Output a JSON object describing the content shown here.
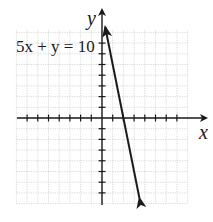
{
  "chart_data": {
    "type": "line",
    "title": "",
    "xlabel": "x",
    "ylabel": "y",
    "equation_label": "5x + y = 10",
    "grid": true,
    "xlim": [
      -8,
      8
    ],
    "ylim": [
      -8,
      8
    ],
    "series": [
      {
        "name": "5x + y = 10",
        "equation": "y = -5x + 10",
        "points": [
          {
            "x": 0.3,
            "y": 8.5
          },
          {
            "x": 2,
            "y": 0
          },
          {
            "x": 3.5,
            "y": -7.5
          }
        ],
        "x_intercept": 2,
        "y_intercept": 10,
        "arrows": "both"
      }
    ],
    "colors": {
      "line": "#1a1a1a",
      "grid": "#c8c8c8",
      "axis": "#1a1a1a"
    }
  }
}
